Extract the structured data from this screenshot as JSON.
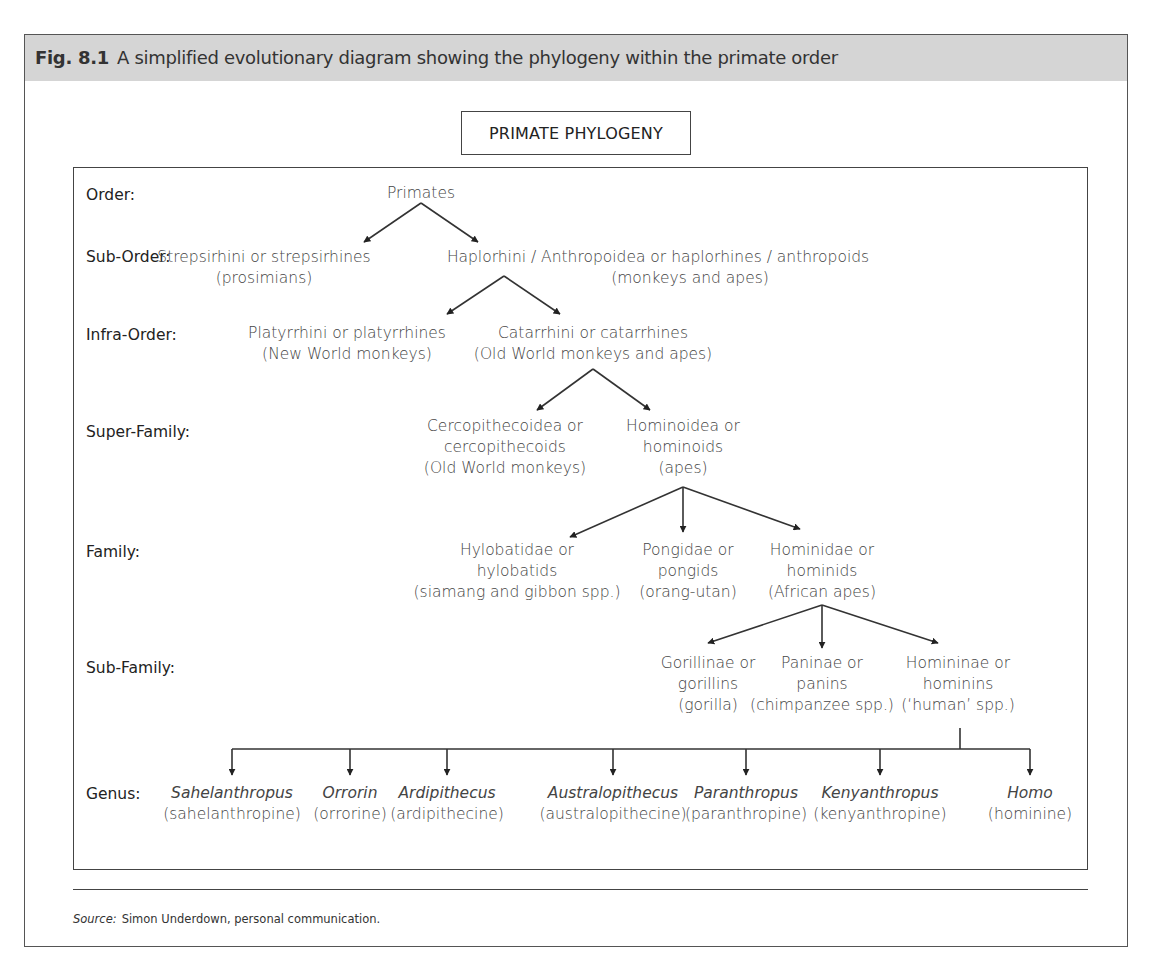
{
  "figure": {
    "number": "Fig. 8.1",
    "caption": "A simplified evolutionary diagram showing the phylogeny within the primate order",
    "title": "PRIMATE PHYLOGENY"
  },
  "ranks": [
    {
      "label": "Order:",
      "y": 195
    },
    {
      "label": "Sub-Order:",
      "y": 257
    },
    {
      "label": "Infra-Order:",
      "y": 335
    },
    {
      "label": "Super-Family:",
      "y": 432
    },
    {
      "label": "Family:",
      "y": 552
    },
    {
      "label": "Sub-Family:",
      "y": 668
    },
    {
      "label": "Genus:",
      "y": 794
    }
  ],
  "taxa": {
    "order": [
      {
        "lines": [
          "Primates"
        ],
        "x": 421,
        "y": 183
      }
    ],
    "suborder": [
      {
        "lines": [
          "Strepsirhini or strepsirhines",
          "(prosimians)"
        ],
        "x": 264,
        "y": 247
      },
      {
        "lines": [
          "Haplorhini / Anthropoidea or haplorhines / anthropoids"
        ],
        "x": 658,
        "y": 247
      },
      {
        "lines": [
          "(monkeys and apes)"
        ],
        "x": 690,
        "y": 268
      }
    ],
    "infraorder": [
      {
        "lines": [
          "Platyrrhini or platyrrhines",
          "(New World monkeys)"
        ],
        "x": 347,
        "y": 323
      },
      {
        "lines": [
          "Catarrhini or catarrhines",
          "(Old World monkeys and apes)"
        ],
        "x": 593,
        "y": 323
      }
    ],
    "superfamily": [
      {
        "lines": [
          "Cercopithecoidea or",
          "cercopithecoids",
          "(Old World monkeys)"
        ],
        "x": 505,
        "y": 416
      },
      {
        "lines": [
          "Hominoidea or",
          "hominoids",
          "(apes)"
        ],
        "x": 683,
        "y": 416
      }
    ],
    "family": [
      {
        "lines": [
          "Hylobatidae or",
          "hylobatids",
          "(siamang and gibbon spp.)"
        ],
        "x": 517,
        "y": 540
      },
      {
        "lines": [
          "Pongidae or",
          "pongids",
          "(orang-utan)"
        ],
        "x": 688,
        "y": 540
      },
      {
        "lines": [
          "Hominidae or",
          "hominids",
          "(African apes)"
        ],
        "x": 822,
        "y": 540
      }
    ],
    "subfamily": [
      {
        "lines": [
          "Gorillinae or",
          "gorillins",
          "(gorilla)"
        ],
        "x": 708,
        "y": 653
      },
      {
        "lines": [
          "Paninae or",
          "panins",
          "(chimpanzee spp.)"
        ],
        "x": 822,
        "y": 653
      },
      {
        "lines": [
          "Homininae or",
          "hominins",
          "(‘human’ spp.)"
        ],
        "x": 958,
        "y": 653
      }
    ],
    "genus": [
      {
        "name": "Sahelanthropus",
        "common": "(sahelanthropine)",
        "x": 232
      },
      {
        "name": "Orrorin",
        "common": "(orrorine)",
        "x": 350
      },
      {
        "name": "Ardipithecus",
        "common": "(ardipithecine)",
        "x": 447
      },
      {
        "name": "Australopithecus",
        "common": "(australopithecine)",
        "x": 613
      },
      {
        "name": "Paranthropus",
        "common": "(paranthropine)",
        "x": 746
      },
      {
        "name": "Kenyanthropus",
        "common": "(kenyanthropine)",
        "x": 880
      },
      {
        "name": "Homo",
        "common": "(hominine)",
        "x": 1030
      }
    ]
  },
  "arrows": [
    {
      "from": [
        421,
        203
      ],
      "to": [
        364,
        242
      ]
    },
    {
      "from": [
        421,
        203
      ],
      "to": [
        478,
        242
      ]
    },
    {
      "from": [
        504,
        276
      ],
      "to": [
        447,
        314
      ]
    },
    {
      "from": [
        504,
        276
      ],
      "to": [
        560,
        314
      ]
    },
    {
      "from": [
        593,
        369
      ],
      "to": [
        537,
        410
      ]
    },
    {
      "from": [
        593,
        369
      ],
      "to": [
        650,
        410
      ]
    },
    {
      "from": [
        683,
        487
      ],
      "to": [
        570,
        537
      ]
    },
    {
      "from": [
        683,
        487
      ],
      "to": [
        683,
        532
      ]
    },
    {
      "from": [
        683,
        487
      ],
      "to": [
        800,
        529
      ]
    },
    {
      "from": [
        822,
        605
      ],
      "to": [
        708,
        643
      ]
    },
    {
      "from": [
        822,
        605
      ],
      "to": [
        822,
        648
      ]
    },
    {
      "from": [
        822,
        605
      ],
      "to": [
        938,
        643
      ]
    }
  ],
  "genus_bar": {
    "y": 749,
    "x1": 232,
    "x2": 1030,
    "stem_x": 960,
    "stem_top": 728,
    "arrow_bottom": 775
  },
  "source": {
    "label": "Source:",
    "text": "Simon Underdown, personal communication."
  },
  "colors": {
    "header_band": "#d5d5d5",
    "line": "#333333",
    "text": "#3a3a3a"
  }
}
